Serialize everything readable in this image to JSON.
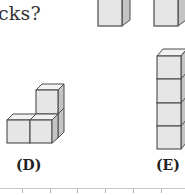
{
  "question": {
    "fragment": "cks?"
  },
  "options": [
    {
      "label": "(D)",
      "shape": "L-shape",
      "cube_count": 3,
      "description": "two cubes on bottom row, one cube stacked on the right cube"
    },
    {
      "label": "(E)",
      "shape": "tower",
      "cube_count": 4,
      "description": "four cubes stacked vertically"
    }
  ],
  "top_row": {
    "description": "partially visible single cubes from options above",
    "cube_count": 2
  },
  "colors": {
    "cube_front": "#e6e6e6",
    "cube_top": "#f2f2f2",
    "cube_side": "#c4c4c4",
    "edge": "#4a4a4a"
  }
}
